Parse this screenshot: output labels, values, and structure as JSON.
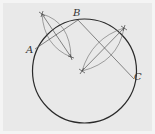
{
  "diagram": {
    "colors": {
      "background": "#e9e9e9",
      "circle": "#2a2a2a",
      "construction": "#555555"
    },
    "circle": {
      "cx": 84.5,
      "cy": 71,
      "r": 52
    },
    "points": [
      {
        "id": "A",
        "label": "A",
        "x": 35,
        "y": 49,
        "label_x": 26,
        "label_y": 53
      },
      {
        "id": "B",
        "label": "B",
        "x": 78,
        "y": 20,
        "label_x": 73,
        "label_y": 16
      },
      {
        "id": "C",
        "label": "C",
        "x": 131,
        "y": 76,
        "label_x": 134,
        "label_y": 80
      }
    ],
    "chords": [
      {
        "from": "A",
        "to": "B"
      },
      {
        "from": "B",
        "to": "C"
      }
    ],
    "bisectors": [
      {
        "x1": 42,
        "y1": 14,
        "x2": 71,
        "y2": 57
      },
      {
        "x1": 124,
        "y1": 28,
        "x2": 82,
        "y2": 71
      }
    ],
    "centre": {
      "x": 82,
      "y": 71
    }
  }
}
